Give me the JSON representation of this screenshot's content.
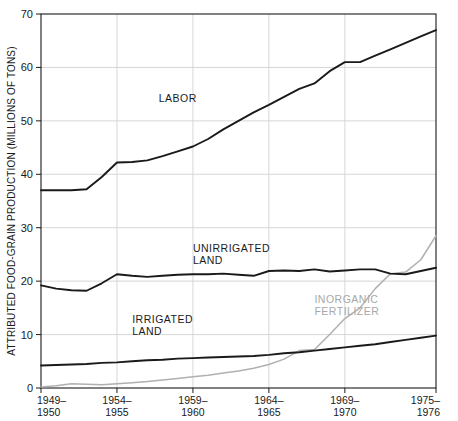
{
  "chart_data": {
    "type": "line",
    "title": "",
    "xlabel": "",
    "ylabel": "ATTRIBUTED FOOD-GRAIN PRODUCTION (MILLIONS OF TONS)",
    "ylim": [
      0,
      70
    ],
    "yticks": [
      0,
      10,
      20,
      30,
      40,
      50,
      60,
      70
    ],
    "ytick_labels": [
      "0",
      "10",
      "20",
      "30",
      "40",
      "50",
      "60",
      "70"
    ],
    "grid": true,
    "legend_position": "inline-annotations",
    "x": [
      "1949-1950",
      "1950-1951",
      "1951-1952",
      "1952-1953",
      "1953-1954",
      "1954-1955",
      "1955-1956",
      "1956-1957",
      "1957-1958",
      "1958-1959",
      "1959-1960",
      "1960-1961",
      "1961-1962",
      "1962-1963",
      "1963-1964",
      "1964-1965",
      "1965-1966",
      "1966-1967",
      "1967-1968",
      "1968-1969",
      "1969-1970",
      "1970-1971",
      "1971-1972",
      "1972-1973",
      "1973-1974",
      "1974-1975",
      "1975-1976"
    ],
    "xticks": [
      "1949-1950",
      "1954-1955",
      "1959-1960",
      "1964-1965",
      "1969-1970",
      "1975-1976"
    ],
    "xtick_labels_line1": [
      "1949–",
      "1954–",
      "1959–",
      "1964–",
      "1969–",
      "1975–"
    ],
    "xtick_labels_line2": [
      "1950",
      "1955",
      "1960",
      "1965",
      "1970",
      "1976"
    ],
    "series": [
      {
        "name": "LABOR",
        "color": "#1a1a1a",
        "label_x": "1958-1959",
        "label_y": 53.5,
        "values": [
          37.0,
          37.0,
          37.0,
          37.2,
          39.5,
          42.2,
          42.3,
          42.6,
          43.4,
          44.3,
          45.2,
          46.6,
          48.4,
          50.0,
          51.6,
          53.0,
          54.5,
          56.0,
          57.0,
          59.3,
          61.0,
          61.0,
          62.2,
          63.4,
          64.6,
          65.8,
          67.0
        ]
      },
      {
        "name": "UNIRRIGATED LAND",
        "color": "#1a1a1a",
        "label_x": "1959-1960",
        "label_y": 25.5,
        "values": [
          19.2,
          18.6,
          18.3,
          18.2,
          19.6,
          21.3,
          21.0,
          20.8,
          21.0,
          21.2,
          21.3,
          21.3,
          21.4,
          21.2,
          21.0,
          21.9,
          22.0,
          21.9,
          22.2,
          21.8,
          22.0,
          22.2,
          22.2,
          21.4,
          21.3,
          21.9,
          22.5
        ]
      },
      {
        "name": "IRRIGATED LAND",
        "color": "#1a1a1a",
        "label_x": "1955-1956",
        "label_y": 12.2,
        "values": [
          4.2,
          4.3,
          4.4,
          4.5,
          4.7,
          4.8,
          5.0,
          5.2,
          5.3,
          5.5,
          5.6,
          5.7,
          5.8,
          5.9,
          6.0,
          6.2,
          6.5,
          6.7,
          7.0,
          7.3,
          7.6,
          7.9,
          8.2,
          8.6,
          9.0,
          9.4,
          9.8
        ]
      },
      {
        "name": "INORGANIC FERTILIZER",
        "color": "#b0b0b0",
        "label_x": "1967-1968",
        "label_y": 16.0,
        "values": [
          0.2,
          0.4,
          0.8,
          0.7,
          0.6,
          0.8,
          1.0,
          1.2,
          1.5,
          1.8,
          2.1,
          2.4,
          2.8,
          3.2,
          3.7,
          4.4,
          5.4,
          7.0,
          7.2,
          10.0,
          13.0,
          15.0,
          18.6,
          21.4,
          21.7,
          24.0,
          28.5
        ]
      }
    ]
  }
}
